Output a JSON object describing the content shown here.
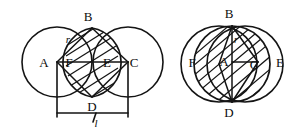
{
  "figure": {
    "background_color": "#ffffff",
    "stroke_color": "#141414",
    "width": 306,
    "height": 130
  },
  "left_diagram": {
    "name": "two-circles-lens",
    "circle_left": {
      "cx": 57,
      "cy": 62,
      "r": 35
    },
    "circle_right": {
      "cx": 128,
      "cy": 62,
      "r": 35
    },
    "points": {
      "A": {
        "x": 57,
        "y": 62,
        "label": "A",
        "label_x": 44,
        "label_y": 67
      },
      "B": {
        "x": 92,
        "y": 28,
        "label": "B",
        "label_x": 88,
        "label_y": 21
      },
      "C": {
        "x": 128,
        "y": 62,
        "label": "C",
        "label_x": 133,
        "label_y": 67
      },
      "D": {
        "x": 92,
        "y": 97,
        "label": "D",
        "label_x": 88,
        "label_y": 110
      },
      "E": {
        "x": 107,
        "y": 62,
        "label": "E",
        "label_x": 106,
        "label_y": 67
      },
      "F": {
        "x": 78,
        "y": 62,
        "label": "F",
        "label_x": 66,
        "label_y": 67
      }
    },
    "radius_label": {
      "text": "r",
      "x": 68,
      "y": 42
    },
    "length_label": {
      "text": "l",
      "x": 98,
      "y": 124
    },
    "dimension": {
      "x1": 57,
      "x2": 128,
      "y": 113
    },
    "hatch_count": 7
  },
  "right_diagram": {
    "name": "two-circles-full-hatch",
    "circle_left": {
      "cx": 219,
      "cy": 64,
      "r": 38
    },
    "circle_right": {
      "cx": 245,
      "cy": 64,
      "r": 38
    },
    "points": {
      "A": {
        "x": 232,
        "y": 62,
        "label": "A",
        "label_x": 222,
        "label_y": 66
      },
      "B": {
        "x": 232,
        "y": 26,
        "label": "B",
        "label_x": 227,
        "label_y": 18
      },
      "C": {
        "x": 258,
        "y": 62,
        "label": "C",
        "label_x": 251,
        "label_y": 68
      },
      "D": {
        "x": 232,
        "y": 102,
        "label": "D",
        "label_x": 227,
        "label_y": 116
      },
      "E": {
        "x": 283,
        "y": 62,
        "label": "E",
        "label_x": 279,
        "label_y": 67
      },
      "F": {
        "x": 181,
        "y": 62,
        "label": "F",
        "label_x": 190,
        "label_y": 67
      }
    },
    "radius_label": {
      "text": "r",
      "x": 235,
      "y": 42
    },
    "hatch_count": 11
  },
  "labels": {
    "point_a": "A",
    "point_b": "B",
    "point_c": "C",
    "point_d": "D",
    "point_e": "E",
    "point_f": "F",
    "radius": "r",
    "length": "l"
  }
}
